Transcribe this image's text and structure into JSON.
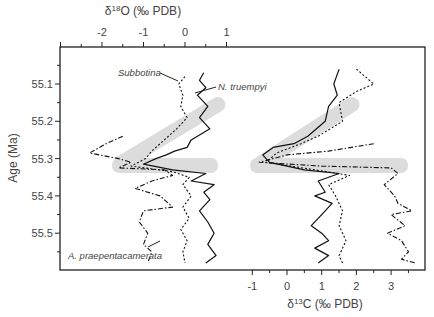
{
  "chart_data": {
    "type": "line",
    "title": "",
    "ylabel": "Age (Ma)",
    "ylim": [
      55.0,
      55.6
    ],
    "y_ticks": [
      "55.1",
      "55.2",
      "55.3",
      "55.4",
      "55.5"
    ],
    "grid": false,
    "panels": [
      {
        "name": "oxygen",
        "xlabel": "δ18O (‰ PDB)",
        "xlabel_parts": {
          "delta": "δ",
          "sup": "18",
          "rest": "O (‰ PDB)"
        },
        "axis_position": "top",
        "x_ticks": [
          "-2",
          "-1",
          "0",
          "1"
        ],
        "xlim": [
          -3,
          1.8
        ],
        "series": [
          {
            "name": "N. truempyi",
            "style": "solid",
            "points": [
              [
                0.45,
                55.07
              ],
              [
                0.35,
                55.09
              ],
              [
                0.5,
                55.11
              ],
              [
                0.3,
                55.13
              ],
              [
                0.55,
                55.16
              ],
              [
                0.35,
                55.19
              ],
              [
                0.6,
                55.22
              ],
              [
                0.15,
                55.25
              ],
              [
                0.05,
                55.27
              ],
              [
                -0.25,
                55.28
              ],
              [
                -0.45,
                55.29
              ],
              [
                -0.7,
                55.3
              ],
              [
                -1.0,
                55.315
              ],
              [
                -0.3,
                55.33
              ],
              [
                0.5,
                55.34
              ],
              [
                0.15,
                55.36
              ],
              [
                0.7,
                55.37
              ],
              [
                0.45,
                55.39
              ],
              [
                0.6,
                55.41
              ],
              [
                0.35,
                55.44
              ],
              [
                0.55,
                55.47
              ],
              [
                0.7,
                55.5
              ],
              [
                0.55,
                55.53
              ],
              [
                0.75,
                55.56
              ],
              [
                0.5,
                55.58
              ]
            ]
          },
          {
            "name": "Subbotina",
            "style": "dotted",
            "points": [
              [
                0.0,
                55.08
              ],
              [
                -0.15,
                55.1
              ],
              [
                -0.05,
                55.13
              ],
              [
                -0.1,
                55.16
              ],
              [
                0.05,
                55.19
              ],
              [
                -0.2,
                55.22
              ],
              [
                -0.5,
                55.25
              ],
              [
                -0.8,
                55.28
              ],
              [
                -0.95,
                55.3
              ],
              [
                -1.3,
                55.32
              ],
              [
                -0.3,
                55.335
              ],
              [
                0.1,
                55.35
              ],
              [
                -0.05,
                55.37
              ],
              [
                0.15,
                55.4
              ],
              [
                -0.05,
                55.43
              ],
              [
                0.1,
                55.46
              ],
              [
                -0.1,
                55.49
              ],
              [
                0.05,
                55.52
              ],
              [
                -0.05,
                55.55
              ],
              [
                0.0,
                55.58
              ]
            ]
          },
          {
            "name": "A. praepentacamerata",
            "style": "dash-dot",
            "points": [
              [
                -1.5,
                55.24
              ],
              [
                -1.9,
                55.26
              ],
              [
                -2.3,
                55.285
              ],
              [
                -1.6,
                55.3
              ],
              [
                -1.3,
                55.31
              ],
              [
                -1.6,
                55.325
              ],
              [
                -0.5,
                55.33
              ],
              [
                -0.3,
                55.345
              ],
              [
                -0.8,
                55.36
              ],
              [
                -1.2,
                55.38
              ],
              [
                -0.6,
                55.4
              ],
              [
                -0.3,
                55.43
              ],
              [
                -1.0,
                55.44
              ],
              [
                -1.1,
                55.47
              ],
              [
                -0.9,
                55.5
              ],
              [
                -1.0,
                55.53
              ],
              [
                -0.8,
                55.55
              ],
              [
                -0.9,
                55.58
              ]
            ]
          }
        ]
      },
      {
        "name": "carbon",
        "xlabel": "δ13C (‰ PDB)",
        "xlabel_parts": {
          "delta": "δ",
          "sup": "13",
          "rest": "C (‰ PDB)"
        },
        "axis_position": "bottom",
        "x_ticks": [
          "-1",
          "0",
          "1",
          "2",
          "3"
        ],
        "xlim": [
          -1.6,
          4.0
        ],
        "series": [
          {
            "name": "N. truempyi",
            "style": "solid",
            "points": [
              [
                1.5,
                55.06
              ],
              [
                1.35,
                55.1
              ],
              [
                1.45,
                55.13
              ],
              [
                1.2,
                55.16
              ],
              [
                1.1,
                55.2
              ],
              [
                0.6,
                55.24
              ],
              [
                0.2,
                55.26
              ],
              [
                -0.4,
                55.27
              ],
              [
                -0.7,
                55.29
              ],
              [
                -0.5,
                55.31
              ],
              [
                0.5,
                55.33
              ],
              [
                1.5,
                55.34
              ],
              [
                0.9,
                55.36
              ],
              [
                1.1,
                55.39
              ],
              [
                0.8,
                55.4
              ],
              [
                1.3,
                55.42
              ],
              [
                1.0,
                55.45
              ],
              [
                0.7,
                55.48
              ],
              [
                1.0,
                55.5
              ],
              [
                1.2,
                55.52
              ],
              [
                0.8,
                55.54
              ],
              [
                1.2,
                55.56
              ],
              [
                0.9,
                55.58
              ]
            ]
          },
          {
            "name": "Subbotina",
            "style": "dotted",
            "points": [
              [
                2.0,
                55.06
              ],
              [
                2.5,
                55.1
              ],
              [
                2.0,
                55.12
              ],
              [
                1.5,
                55.15
              ],
              [
                1.6,
                55.2
              ],
              [
                0.9,
                55.24
              ],
              [
                0.4,
                55.26
              ],
              [
                -0.3,
                55.285
              ],
              [
                -0.6,
                55.31
              ],
              [
                0.8,
                55.33
              ],
              [
                1.8,
                55.345
              ],
              [
                1.2,
                55.37
              ],
              [
                1.4,
                55.4
              ],
              [
                1.6,
                55.44
              ],
              [
                1.5,
                55.48
              ],
              [
                1.7,
                55.52
              ],
              [
                1.5,
                55.56
              ],
              [
                1.6,
                55.58
              ]
            ]
          },
          {
            "name": "A. praepentacamerata",
            "style": "dash-dot",
            "points": [
              [
                2.5,
                55.26
              ],
              [
                1.2,
                55.28
              ],
              [
                0.0,
                55.29
              ],
              [
                -0.8,
                55.31
              ],
              [
                1.0,
                55.32
              ],
              [
                3.0,
                55.325
              ],
              [
                3.2,
                55.34
              ],
              [
                2.8,
                55.37
              ],
              [
                3.1,
                55.4
              ],
              [
                3.2,
                55.42
              ],
              [
                3.6,
                55.44
              ],
              [
                3.0,
                55.45
              ],
              [
                3.4,
                55.48
              ],
              [
                2.9,
                55.5
              ],
              [
                3.3,
                55.52
              ],
              [
                3.5,
                55.55
              ],
              [
                3.3,
                55.57
              ],
              [
                3.7,
                55.58
              ]
            ]
          }
        ]
      }
    ],
    "highlight_bands": [
      {
        "type": "horizontal",
        "age": 55.32,
        "panel": "both"
      },
      {
        "type": "diagonal",
        "panel": "oxygen",
        "from_age": 55.31,
        "to_age": 55.15
      },
      {
        "type": "diagonal",
        "panel": "carbon",
        "from_age": 55.31,
        "to_age": 55.15
      }
    ],
    "annotations": [
      {
        "text": "Subbotina",
        "target": "Subbotina"
      },
      {
        "text": "N. truempyi",
        "target": "N. truempyi"
      },
      {
        "text": "A. praepentacamerata",
        "target": "A. praepentacamerata"
      }
    ]
  },
  "labels": {
    "top_axis_title": "δ18O (‰ PDB)",
    "bottom_axis_title": "δ13C (‰ PDB)",
    "y_axis_title": "Age (Ma)",
    "subbotina": "Subbotina",
    "truempyi": "N. truempyi",
    "praepenta": "A. praepentacamerata"
  }
}
